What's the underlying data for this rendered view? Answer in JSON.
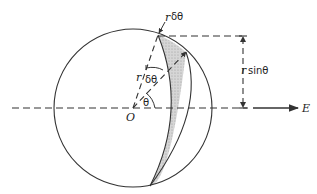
{
  "figure": {
    "labels": {
      "r_delta_theta_top": "δθ",
      "r_top": "r",
      "r_sin_theta_r": "r",
      "sin_theta": "sinθ",
      "r_radius": "r",
      "delta_theta": "δθ",
      "theta": "θ",
      "origin": "O",
      "field": "E"
    },
    "colors": {
      "stroke": "#333333",
      "shade": "#c8c8c8"
    }
  }
}
